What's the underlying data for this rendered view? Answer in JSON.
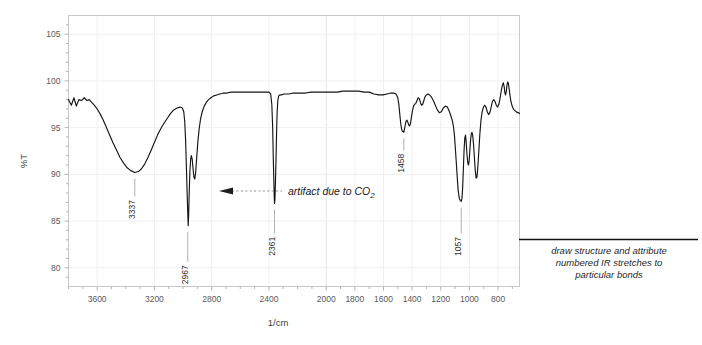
{
  "chart_data": {
    "type": "line",
    "title": "",
    "xlabel": "1/cm",
    "ylabel": "%T",
    "xlim": [
      3800,
      650
    ],
    "ylim": [
      78,
      107
    ],
    "x_ticks": [
      3600,
      3200,
      2800,
      2400,
      2000,
      1800,
      1600,
      1400,
      1200,
      1000,
      800
    ],
    "x_tick_labels": [
      "3600",
      "3200",
      "2800",
      "2400",
      "2000",
      "1800",
      "1600",
      "1400",
      "1200",
      "1000",
      "800"
    ],
    "y_ticks": [
      80,
      85,
      90,
      95,
      100,
      105
    ],
    "y_tick_labels": [
      "80",
      "85",
      "90",
      "95",
      "100",
      "105"
    ],
    "grid": true,
    "legend": "none",
    "series": [
      {
        "name": "transmittance",
        "points": [
          [
            3800,
            98.0
          ],
          [
            3780,
            97.4
          ],
          [
            3762,
            98.2
          ],
          [
            3745,
            97.3
          ],
          [
            3728,
            98.0
          ],
          [
            3710,
            97.9
          ],
          [
            3690,
            98.2
          ],
          [
            3672,
            97.9
          ],
          [
            3655,
            98.0
          ],
          [
            3638,
            97.7
          ],
          [
            3620,
            97.4
          ],
          [
            3600,
            97.0
          ],
          [
            3580,
            96.5
          ],
          [
            3560,
            95.9
          ],
          [
            3540,
            95.2
          ],
          [
            3515,
            94.3
          ],
          [
            3490,
            93.4
          ],
          [
            3465,
            92.6
          ],
          [
            3440,
            91.8
          ],
          [
            3415,
            91.2
          ],
          [
            3390,
            90.7
          ],
          [
            3365,
            90.4
          ],
          [
            3337,
            90.2
          ],
          [
            3312,
            90.3
          ],
          [
            3290,
            90.6
          ],
          [
            3268,
            91.1
          ],
          [
            3245,
            91.8
          ],
          [
            3222,
            92.6
          ],
          [
            3200,
            93.4
          ],
          [
            3178,
            94.2
          ],
          [
            3155,
            94.9
          ],
          [
            3132,
            95.5
          ],
          [
            3110,
            96.0
          ],
          [
            3088,
            96.5
          ],
          [
            3065,
            96.9
          ],
          [
            3042,
            97.1
          ],
          [
            3020,
            97.2
          ],
          [
            3005,
            97.1
          ],
          [
            2995,
            96.7
          ],
          [
            2988,
            95.6
          ],
          [
            2982,
            93.6
          ],
          [
            2977,
            91.0
          ],
          [
            2972,
            88.3
          ],
          [
            2967,
            85.9
          ],
          [
            2964,
            84.5
          ],
          [
            2961,
            85.6
          ],
          [
            2957,
            88.0
          ],
          [
            2952,
            90.3
          ],
          [
            2947,
            91.6
          ],
          [
            2942,
            92.0
          ],
          [
            2936,
            91.6
          ],
          [
            2930,
            90.6
          ],
          [
            2924,
            89.7
          ],
          [
            2918,
            89.5
          ],
          [
            2912,
            90.2
          ],
          [
            2905,
            91.7
          ],
          [
            2897,
            93.4
          ],
          [
            2888,
            94.8
          ],
          [
            2878,
            95.9
          ],
          [
            2866,
            96.7
          ],
          [
            2852,
            97.3
          ],
          [
            2838,
            97.7
          ],
          [
            2822,
            98.0
          ],
          [
            2805,
            98.2
          ],
          [
            2786,
            98.4
          ],
          [
            2765,
            98.5
          ],
          [
            2742,
            98.6
          ],
          [
            2718,
            98.7
          ],
          [
            2692,
            98.7
          ],
          [
            2665,
            98.8
          ],
          [
            2636,
            98.8
          ],
          [
            2605,
            98.8
          ],
          [
            2572,
            98.8
          ],
          [
            2538,
            98.8
          ],
          [
            2502,
            98.8
          ],
          [
            2465,
            98.8
          ],
          [
            2430,
            98.8
          ],
          [
            2400,
            98.8
          ],
          [
            2388,
            98.6
          ],
          [
            2380,
            97.5
          ],
          [
            2374,
            95.0
          ],
          [
            2370,
            92.0
          ],
          [
            2366,
            89.4
          ],
          [
            2363,
            87.6
          ],
          [
            2361,
            86.9
          ],
          [
            2358,
            87.4
          ],
          [
            2355,
            88.9
          ],
          [
            2351,
            91.4
          ],
          [
            2347,
            94.2
          ],
          [
            2343,
            96.6
          ],
          [
            2338,
            97.9
          ],
          [
            2332,
            98.4
          ],
          [
            2324,
            98.5
          ],
          [
            2312,
            98.5
          ],
          [
            2298,
            98.6
          ],
          [
            2280,
            98.6
          ],
          [
            2258,
            98.6
          ],
          [
            2232,
            98.7
          ],
          [
            2205,
            98.7
          ],
          [
            2175,
            98.7
          ],
          [
            2142,
            98.7
          ],
          [
            2108,
            98.8
          ],
          [
            2072,
            98.8
          ],
          [
            2035,
            98.8
          ],
          [
            1998,
            98.8
          ],
          [
            1960,
            98.8
          ],
          [
            1922,
            98.8
          ],
          [
            1884,
            98.9
          ],
          [
            1846,
            98.9
          ],
          [
            1808,
            98.9
          ],
          [
            1772,
            98.9
          ],
          [
            1736,
            98.8
          ],
          [
            1700,
            98.8
          ],
          [
            1666,
            98.6
          ],
          [
            1634,
            98.5
          ],
          [
            1604,
            98.5
          ],
          [
            1576,
            98.6
          ],
          [
            1550,
            98.7
          ],
          [
            1528,
            98.7
          ],
          [
            1512,
            98.6
          ],
          [
            1500,
            98.2
          ],
          [
            1492,
            97.4
          ],
          [
            1486,
            96.4
          ],
          [
            1480,
            95.5
          ],
          [
            1474,
            94.9
          ],
          [
            1468,
            94.6
          ],
          [
            1462,
            94.6
          ],
          [
            1458,
            94.5
          ],
          [
            1454,
            94.8
          ],
          [
            1448,
            95.3
          ],
          [
            1442,
            95.7
          ],
          [
            1436,
            95.8
          ],
          [
            1430,
            95.6
          ],
          [
            1424,
            95.3
          ],
          [
            1418,
            95.2
          ],
          [
            1412,
            95.4
          ],
          [
            1405,
            96.1
          ],
          [
            1398,
            96.8
          ],
          [
            1390,
            97.3
          ],
          [
            1382,
            97.5
          ],
          [
            1374,
            97.6
          ],
          [
            1366,
            97.9
          ],
          [
            1358,
            98.2
          ],
          [
            1350,
            98.1
          ],
          [
            1342,
            97.7
          ],
          [
            1334,
            97.4
          ],
          [
            1326,
            97.5
          ],
          [
            1318,
            97.9
          ],
          [
            1310,
            98.3
          ],
          [
            1300,
            98.5
          ],
          [
            1290,
            98.6
          ],
          [
            1278,
            98.5
          ],
          [
            1266,
            98.3
          ],
          [
            1252,
            97.9
          ],
          [
            1238,
            97.4
          ],
          [
            1224,
            96.9
          ],
          [
            1210,
            96.6
          ],
          [
            1196,
            96.7
          ],
          [
            1182,
            97.1
          ],
          [
            1168,
            97.3
          ],
          [
            1154,
            97.2
          ],
          [
            1142,
            96.8
          ],
          [
            1130,
            96.3
          ],
          [
            1120,
            95.8
          ],
          [
            1112,
            95.2
          ],
          [
            1105,
            94.3
          ],
          [
            1099,
            93.0
          ],
          [
            1092,
            91.4
          ],
          [
            1085,
            89.7
          ],
          [
            1078,
            88.2
          ],
          [
            1070,
            87.4
          ],
          [
            1063,
            87.2
          ],
          [
            1057,
            87.1
          ],
          [
            1052,
            87.4
          ],
          [
            1047,
            88.6
          ],
          [
            1042,
            90.6
          ],
          [
            1037,
            92.6
          ],
          [
            1032,
            93.9
          ],
          [
            1027,
            94.2
          ],
          [
            1022,
            93.4
          ],
          [
            1017,
            92.2
          ],
          [
            1012,
            91.3
          ],
          [
            1007,
            91.0
          ],
          [
            1002,
            91.4
          ],
          [
            997,
            92.5
          ],
          [
            992,
            93.6
          ],
          [
            987,
            94.3
          ],
          [
            982,
            94.5
          ],
          [
            977,
            94.2
          ],
          [
            971,
            93.2
          ],
          [
            965,
            91.8
          ],
          [
            959,
            90.4
          ],
          [
            953,
            89.6
          ],
          [
            947,
            89.7
          ],
          [
            941,
            90.8
          ],
          [
            934,
            92.5
          ],
          [
            927,
            94.3
          ],
          [
            919,
            95.8
          ],
          [
            911,
            96.7
          ],
          [
            902,
            97.2
          ],
          [
            893,
            97.4
          ],
          [
            884,
            97.2
          ],
          [
            875,
            96.7
          ],
          [
            866,
            96.4
          ],
          [
            857,
            96.6
          ],
          [
            848,
            97.2
          ],
          [
            839,
            97.8
          ],
          [
            830,
            98.0
          ],
          [
            821,
            97.8
          ],
          [
            812,
            97.4
          ],
          [
            803,
            97.2
          ],
          [
            794,
            97.5
          ],
          [
            785,
            98.2
          ],
          [
            777,
            99.0
          ],
          [
            770,
            99.5
          ],
          [
            763,
            99.8
          ],
          [
            757,
            99.4
          ],
          [
            752,
            98.7
          ],
          [
            747,
            98.5
          ],
          [
            742,
            98.9
          ],
          [
            737,
            99.6
          ],
          [
            732,
            99.9
          ],
          [
            727,
            99.7
          ],
          [
            722,
            99.1
          ],
          [
            716,
            98.4
          ],
          [
            710,
            97.8
          ],
          [
            703,
            97.4
          ],
          [
            696,
            97.1
          ],
          [
            688,
            96.9
          ],
          [
            680,
            96.8
          ],
          [
            672,
            96.7
          ],
          [
            664,
            96.6
          ],
          [
            656,
            96.6
          ],
          [
            650,
            96.5
          ]
        ]
      }
    ],
    "peak_labels": [
      {
        "name": "3337",
        "wavenumber": 3337,
        "transmittance": 90.2
      },
      {
        "name": "2967",
        "wavenumber": 2967,
        "transmittance": 84.5
      },
      {
        "name": "2361",
        "wavenumber": 2361,
        "transmittance": 86.9
      },
      {
        "name": "1458",
        "wavenumber": 1458,
        "transmittance": 94.5
      },
      {
        "name": "1057",
        "wavenumber": 1057,
        "transmittance": 87.1
      }
    ],
    "annotations": [
      {
        "name": "co2-artifact",
        "text": "artifact due to CO",
        "subscript": "2",
        "points_to": 2361
      }
    ]
  },
  "note": {
    "lines": [
      "draw structure and attribute",
      "numbered IR stretches to",
      "particular bonds"
    ]
  },
  "colors": {
    "trace": "#151515",
    "frame": "#c8c8c8",
    "grid": "#f0f0f0",
    "text": "#595959"
  }
}
